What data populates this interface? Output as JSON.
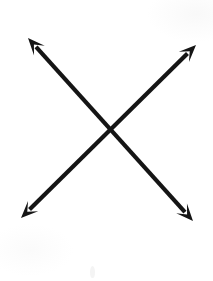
{
  "page": {
    "title": "Crossing Arrows Diagram",
    "width": 213,
    "height": 281,
    "background_color": "#ffffff"
  },
  "style": {
    "stroke_color": "#151515",
    "stroke_width": 4,
    "arrowhead_fill": "#151515",
    "paper_tint_color": "#fafafa"
  },
  "diagram": {
    "type": "line-drawing",
    "shape_name": "x-cross",
    "intersection_point": {
      "x": 111,
      "y": 130
    },
    "arrows": [
      {
        "id": "arrow-nwse",
        "label": "Northwest to southeast double arrow",
        "orientation": "NW-SE",
        "start": {
          "x": 28,
          "y": 38
        },
        "end": {
          "x": 193,
          "y": 221
        },
        "double_headed": true,
        "heads": [
          "start",
          "end"
        ]
      },
      {
        "id": "arrow-nesw",
        "label": "Northeast to southwest double arrow",
        "orientation": "NE-SW",
        "start": {
          "x": 196,
          "y": 45
        },
        "end": {
          "x": 21,
          "y": 218
        },
        "double_headed": true,
        "heads": [
          "start",
          "end"
        ]
      }
    ],
    "arrow_tips": [
      {
        "name": "tip-top-left",
        "x": 28,
        "y": 38,
        "direction": "up-left"
      },
      {
        "name": "tip-top-right",
        "x": 196,
        "y": 45,
        "direction": "up-right"
      },
      {
        "name": "tip-bottom-left",
        "x": 21,
        "y": 218,
        "direction": "down-left"
      },
      {
        "name": "tip-bottom-right",
        "x": 193,
        "y": 221,
        "direction": "down-right"
      }
    ],
    "artifacts": [
      {
        "name": "scan-smudge",
        "x": 92,
        "y": 272,
        "color": "#f4f4f4"
      }
    ]
  }
}
